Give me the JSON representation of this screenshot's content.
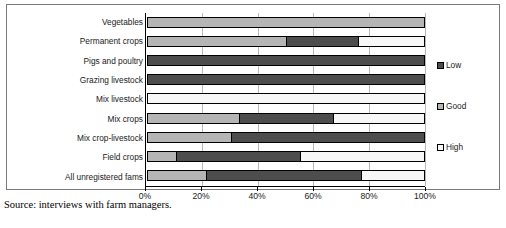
{
  "source_caption": "Source: interviews with farm managers.",
  "legend": {
    "position": "right",
    "items": [
      {
        "label": "Low",
        "color": "#4d4d4d",
        "key": "low"
      },
      {
        "label": "Good",
        "color": "#b5b5b5",
        "key": "good"
      },
      {
        "label": "High",
        "color": "#f7f7f7",
        "key": "high"
      }
    ]
  },
  "axis": {
    "ticks": [
      "0%",
      "20%",
      "40%",
      "60%",
      "80%",
      "100%"
    ],
    "tick_values": [
      0,
      20,
      40,
      60,
      80,
      100
    ]
  },
  "chart_data": {
    "type": "bar",
    "orientation": "horizontal",
    "stacked": true,
    "normalized_percent": true,
    "title": "",
    "xlabel": "",
    "ylabel": "",
    "xlim": [
      0,
      100
    ],
    "grid": true,
    "legend_position": "right",
    "categories": [
      "Vegetables",
      "Permanent crops",
      "Pigs and poultry",
      "Grazing livestock",
      "Mix livestock",
      "Mix crops",
      "Mix crop-livestock",
      "Field crops",
      "All unregistered fams"
    ],
    "stack_order": [
      "Good",
      "Low",
      "High"
    ],
    "series": [
      {
        "name": "Good",
        "color": "#b5b5b5",
        "values": [
          100,
          50,
          0,
          0,
          0,
          33,
          30,
          10,
          21
        ]
      },
      {
        "name": "Low",
        "color": "#4d4d4d",
        "values": [
          0,
          26,
          100,
          100,
          0,
          34,
          70,
          45,
          56
        ]
      },
      {
        "name": "High",
        "color": "#f7f7f7",
        "values": [
          0,
          24,
          0,
          0,
          100,
          33,
          0,
          45,
          23
        ]
      }
    ],
    "rows": [
      {
        "category": "Vegetables",
        "segments": [
          {
            "series": "Good",
            "value": 100
          }
        ]
      },
      {
        "category": "Permanent crops",
        "segments": [
          {
            "series": "Good",
            "value": 50
          },
          {
            "series": "Low",
            "value": 26
          },
          {
            "series": "High",
            "value": 24
          }
        ]
      },
      {
        "category": "Pigs and poultry",
        "segments": [
          {
            "series": "Low",
            "value": 100
          }
        ]
      },
      {
        "category": "Grazing livestock",
        "segments": [
          {
            "series": "Low",
            "value": 100
          }
        ]
      },
      {
        "category": "Mix livestock",
        "segments": [
          {
            "series": "High",
            "value": 100
          }
        ]
      },
      {
        "category": "Mix crops",
        "segments": [
          {
            "series": "Good",
            "value": 33
          },
          {
            "series": "Low",
            "value": 34
          },
          {
            "series": "High",
            "value": 33
          }
        ]
      },
      {
        "category": "Mix crop-livestock",
        "segments": [
          {
            "series": "Good",
            "value": 30
          },
          {
            "series": "Low",
            "value": 70
          }
        ]
      },
      {
        "category": "Field crops",
        "segments": [
          {
            "series": "Good",
            "value": 10
          },
          {
            "series": "Low",
            "value": 45
          },
          {
            "series": "High",
            "value": 45
          }
        ]
      },
      {
        "category": "All unregistered fams",
        "segments": [
          {
            "series": "Good",
            "value": 21
          },
          {
            "series": "Low",
            "value": 56
          },
          {
            "series": "High",
            "value": 23
          }
        ]
      }
    ]
  }
}
